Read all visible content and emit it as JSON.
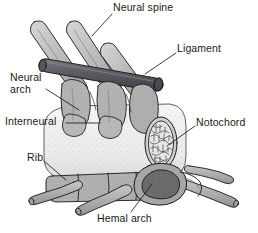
{
  "figure": {
    "name": "fish-vertebra-anatomy-diagram",
    "background_color": "#ffffff",
    "ink_color": "#1a1a1a",
    "width": 258,
    "height": 233
  },
  "labels": [
    {
      "id": "neural-spine",
      "text": "Neural spine",
      "x": 113,
      "y": 5
    },
    {
      "id": "ligament",
      "text": "Ligament",
      "x": 177,
      "y": 46
    },
    {
      "id": "neural-arch-line1",
      "text": "Neural",
      "x": 10,
      "y": 75
    },
    {
      "id": "neural-arch-line2",
      "text": "arch",
      "x": 10,
      "y": 87
    },
    {
      "id": "interneural",
      "text": "Interneural",
      "x": 6,
      "y": 118
    },
    {
      "id": "notochord",
      "text": "Notochord",
      "x": 196,
      "y": 119
    },
    {
      "id": "rib",
      "text": "Rib",
      "x": 27,
      "y": 154
    },
    {
      "id": "hemal-arch",
      "text": "Hemal arch",
      "x": 97,
      "y": 216
    }
  ],
  "parts": [
    {
      "id": "neural-spine",
      "label": "Neural spine",
      "description": "elongated posteriorly-directed dorsal spines"
    },
    {
      "id": "ligament",
      "label": "Ligament",
      "description": "dark cylindrical rod crossing the neural spines"
    },
    {
      "id": "neural-arch",
      "label": "Neural arch",
      "description": "stippled arch over the notochord"
    },
    {
      "id": "interneural",
      "label": "Interneural",
      "description": "interneural element between successive neural arches"
    },
    {
      "id": "notochord",
      "label": "Notochord",
      "description": "oval vacuolated cross-section at the cut end"
    },
    {
      "id": "rib",
      "label": "Rib",
      "description": "tapered ventro-lateral rib shafts"
    },
    {
      "id": "hemal-arch",
      "label": "Hemal arch",
      "description": "ventral ring enclosing the haemal canal"
    }
  ],
  "colors": {
    "outline": "#1a1a1a",
    "ligament_dark": "#58585c",
    "bone_mid": "#a8a8a8",
    "bone_light": "#c9c9c9",
    "sheath_pale": "#efefef",
    "notochord_fill": "#dcdcdc",
    "hemal_fill": "#8c8c8c"
  },
  "leaders": [
    {
      "id": "neural-spine-leader",
      "from": [
        112,
        14
      ],
      "to": [
        94,
        34
      ]
    },
    {
      "id": "ligament-leader",
      "from": [
        176,
        53
      ],
      "to": [
        144,
        73
      ]
    },
    {
      "id": "neural-arch-leader",
      "from": [
        46,
        88
      ],
      "to": [
        78,
        110
      ]
    },
    {
      "id": "interneural-leader",
      "from": [
        66,
        123
      ],
      "to": [
        98,
        123
      ]
    },
    {
      "id": "notochord-leader",
      "from": [
        195,
        126
      ],
      "to": [
        168,
        146
      ]
    },
    {
      "id": "rib-leader",
      "from": [
        44,
        161
      ],
      "to": [
        64,
        178
      ]
    },
    {
      "id": "hemal-arch-leader",
      "from": [
        131,
        212
      ],
      "to": [
        150,
        183
      ]
    }
  ]
}
